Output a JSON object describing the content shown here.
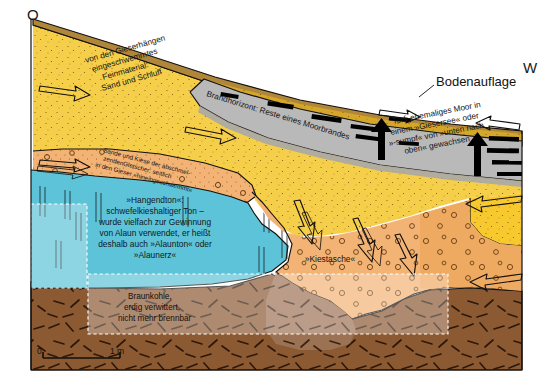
{
  "figure": {
    "width": 553,
    "height": 387
  },
  "compass": {
    "east_label": "O",
    "west_label": "W"
  },
  "callouts": [
    {
      "id": "bodenauflage",
      "label": "Bodenauflage"
    }
  ],
  "layers": [
    {
      "id": "bodenauflage",
      "name": "Bodenauflage",
      "color": "#B0873A",
      "label": "Bodenauflage"
    },
    {
      "id": "sand-schluff",
      "name": "Sand und Schluff",
      "color": "#F5CF4A",
      "label_lines": [
        "von den Gieserhängen",
        "eingeschwemmtes",
        "Feinmaterial:",
        "Sand und Schluff"
      ]
    },
    {
      "id": "brandhorizont",
      "name": "Brandhorizont",
      "color": "#B9B9B9",
      "label": "Brandhorizont: Reste eines Moorbrandes"
    },
    {
      "id": "torf",
      "name": "Torf",
      "color": "#B9B9B9",
      "label_lines": [
        "Torf: ehemaliges Moor in",
        "einem »Giesersee« oder",
        "»-sumpf« von »unten nach",
        "oben« gewachsen"
      ]
    },
    {
      "id": "sande-kiese",
      "name": "Sande und Kiese",
      "color": "#F2B375",
      "label_lines": [
        "Sande und Kiese der abschmel-",
        "zendenGletscher: seitlich",
        "in den Gieser »hineingeschwemmt«"
      ]
    },
    {
      "id": "hangendton",
      "name": "Hangendton",
      "color": "#5DC3D8",
      "label_lines": [
        "»Hangendton«:",
        "schwefelkieshaltiger Ton –",
        "wurde vielfach zur Gewinnung",
        "von Alaun verwendet, er heißt",
        "deshalb auch »Alaunton« oder",
        "»Alaunerz«"
      ]
    },
    {
      "id": "kiestasche",
      "name": "Kiestasche",
      "color": "#F2B375",
      "label": "»Kiestasche«"
    },
    {
      "id": "braunkohle",
      "name": "Braunkohle",
      "color": "#8B5A33",
      "label_lines": [
        "Braunkohle,",
        "erdig verwittert,",
        "nicht mehr brennbar"
      ]
    }
  ],
  "scale_bar": {
    "start_label": "0",
    "end_label": "1 m"
  },
  "palette": {
    "topsoil": "#B0873A",
    "topsoil_dark": "#A5813A",
    "sand_yellow": "#F5CF4A",
    "sand_yellow_deep": "#F7C92E",
    "olive_yellow": "#D4A62A",
    "grey_peat": "#B9B9B9",
    "grey_peat_dark": "#A9A9A9",
    "orange_gravel": "#F2B375",
    "orange_gravel_deep": "#EFAA62",
    "clay_blue": "#5DC3D8",
    "clay_blue_light": "#76CEDF",
    "lignite_brown": "#8B5A33",
    "lignite_brown_light": "#9C7255",
    "outline": "#14100C",
    "charcoal": "#000000",
    "white": "#FFFFFF"
  }
}
